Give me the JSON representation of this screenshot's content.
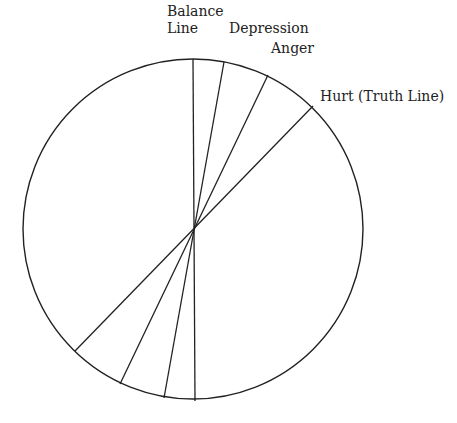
{
  "diagram": {
    "center": [
      193,
      229
    ],
    "radius": 170,
    "stroke": "#222222",
    "lines": [
      {
        "name": "balance-line",
        "top": [
          193,
          59
        ],
        "bottom": [
          195,
          401
        ]
      },
      {
        "name": "depression-line",
        "top": [
          224,
          62
        ],
        "bottom": [
          164,
          398
        ]
      },
      {
        "name": "anger-line",
        "top": [
          268,
          75
        ],
        "bottom": [
          120,
          384
        ]
      },
      {
        "name": "hurt-truth-line",
        "top": [
          313,
          106
        ],
        "bottom": [
          75,
          351
        ]
      }
    ]
  },
  "labels": {
    "balance_1": "Balance",
    "balance_2": "Line",
    "depression": "Depression",
    "anger": "Anger",
    "hurt": "Hurt (Truth Line)"
  }
}
